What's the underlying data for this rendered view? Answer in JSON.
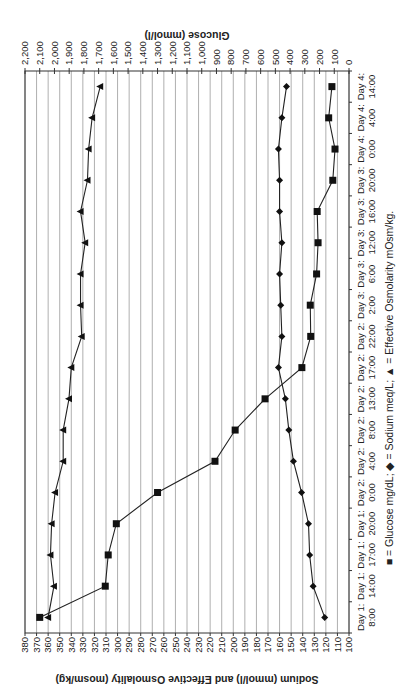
{
  "chart_data": {
    "type": "line",
    "orientation": "rotated 90 degrees (time axis runs bottom-to-top on right side)",
    "title": "",
    "categories": [
      "Day 1: 8:00",
      "Day 1: 14:00",
      "Day 1: 17:00",
      "Day 1: 20:00",
      "Day 2: 0:00",
      "Day 2: 4:00",
      "Day 2: 8:00",
      "Day 2: 13:00",
      "Day 2: 17:00",
      "Day 2: 22:00",
      "Day 3: 2:00",
      "Day 3: 6:00",
      "Day 3: 12:00",
      "Day 3: 16:00",
      "Day 3: 20:00",
      "Day 4: 0:00",
      "Day 4: 4:00",
      "Day 4: 14:00"
    ],
    "category_labels": [
      [
        "Day 1:",
        "8:00"
      ],
      [
        "Day 1:",
        "14:00"
      ],
      [
        "Day 1:",
        "17:00"
      ],
      [
        "Day 1:",
        "20:00"
      ],
      [
        "Day 2:",
        "0:00"
      ],
      [
        "Day 2:",
        "4:00"
      ],
      [
        "Day 2:",
        "8:00"
      ],
      [
        "Day 2:",
        "13:00"
      ],
      [
        "Day 2:",
        "17:00"
      ],
      [
        "Day 2:",
        "22:00"
      ],
      [
        "Day 3:",
        "2:00"
      ],
      [
        "Day 3:",
        "6:00"
      ],
      [
        "Day 3:",
        "12:00"
      ],
      [
        "Day 3:",
        "16:00"
      ],
      [
        "Day 3:",
        "20:00"
      ],
      [
        "Day 4:",
        "0:00"
      ],
      [
        "Day 4:",
        "4:00"
      ],
      [
        "Day 4:",
        "14:00"
      ]
    ],
    "series": [
      {
        "name": "Glucose mg/dL",
        "marker": "square",
        "axis": "secondary",
        "values": [
          2100,
          1655,
          1635,
          1580,
          1300,
          910,
          773,
          570,
          320,
          260,
          263,
          220,
          210,
          216,
          110,
          95,
          138,
          116
        ]
      },
      {
        "name": "Sodium meq/L",
        "marker": "diamond",
        "axis": "primary",
        "values": [
          121,
          131,
          134,
          135,
          141,
          148,
          152,
          155,
          161,
          158,
          159,
          160,
          158,
          160,
          160,
          161,
          158,
          154
        ]
      },
      {
        "name": "Effective Osmolarity mOsm/kg",
        "marker": "triangle",
        "axis": "primary",
        "values": [
          360,
          355,
          358,
          357,
          354,
          347,
          347,
          342,
          340,
          331,
          332,
          332,
          328,
          332,
          326,
          325,
          322,
          315
        ]
      }
    ],
    "primary_axis": {
      "label": "Sodium (mmol/l) and Effective Osmolality (mosm/kg)",
      "range": [
        100,
        380
      ],
      "ticks": [
        380,
        370,
        360,
        350,
        340,
        330,
        320,
        310,
        300,
        290,
        280,
        270,
        260,
        250,
        240,
        230,
        220,
        210,
        200,
        190,
        180,
        170,
        160,
        150,
        140,
        130,
        120,
        110,
        100
      ]
    },
    "secondary_axis": {
      "label": "Glucose (mmol/l)",
      "range": [
        0,
        2200
      ],
      "ticks": [
        "2,200",
        "2,100",
        "2,000",
        "1,900",
        "1,800",
        "1,700",
        "1,600",
        "1,500",
        "1,400",
        "1,300",
        "1,200",
        "1,100",
        "1,000",
        "900",
        "800",
        "700",
        "600",
        "500",
        "400",
        "300",
        "200",
        "100",
        "0"
      ]
    },
    "legend": "■ = Glucose mg/dL; ◆ = Sodium meq/L; ▲ = Effective Osmolarity mOsm/kg.",
    "grid": true
  },
  "colors": {
    "line": "#222222",
    "grid": "#9a9a9a",
    "background": "#ffffff"
  }
}
